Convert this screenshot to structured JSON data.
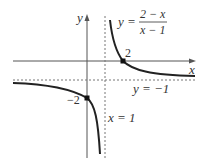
{
  "diagram": {
    "type": "function-graph",
    "function": "y = (2 - x)/(x - 1)",
    "axes": {
      "x_label": "x",
      "y_label": "y"
    },
    "equation_label": {
      "lhs": "y =",
      "numerator": "2 − x",
      "denominator": "x − 1"
    },
    "asymptotes": {
      "vertical": {
        "label": "x = 1",
        "value": 1
      },
      "horizontal": {
        "label": "y = −1",
        "value": -1
      }
    },
    "points": [
      {
        "name": "x-intercept",
        "label": "2",
        "x": 2,
        "y": 0
      },
      {
        "name": "y-intercept",
        "label": "−2",
        "x": 0,
        "y": -2
      }
    ],
    "colors": {
      "curve": "#222222",
      "axes": "#555555",
      "asymptote": "#777777",
      "text": "#333333"
    }
  }
}
